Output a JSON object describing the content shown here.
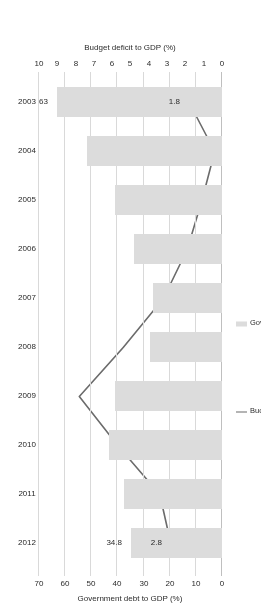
{
  "chart_data": {
    "type": "bar",
    "title": "",
    "orientation": "horizontal",
    "rotated_180": true,
    "categories": [
      "2003",
      "2004",
      "2005",
      "2006",
      "2007",
      "2008",
      "2009",
      "2010",
      "2011",
      "2012"
    ],
    "series": [
      {
        "name": "Government debt to GDP (%)",
        "type": "bar",
        "axis": "top",
        "color": "#dcdcdc",
        "values": [
          63,
          51.5,
          41,
          33.6,
          26.3,
          27.7,
          41.1,
          43.3,
          37.4,
          34.8
        ]
      },
      {
        "name": "Budget deficit to GDP (%)",
        "type": "line",
        "axis": "bottom",
        "color": "#6b6b6b",
        "values": [
          1.8,
          0.4,
          1.1,
          1.9,
          3.2,
          5.4,
          7.8,
          5.7,
          3.4,
          2.8
        ]
      }
    ],
    "data_labels": [
      {
        "category": "2003",
        "series": "Government debt to GDP (%)",
        "text": "63"
      },
      {
        "category": "2003",
        "series": "Budget deficit to GDP (%)",
        "text": "1.8"
      },
      {
        "category": "2012",
        "series": "Government debt to GDP (%)",
        "text": "34.8"
      },
      {
        "category": "2012",
        "series": "Budget deficit to GDP (%)",
        "text": "2.8"
      }
    ],
    "axes": {
      "top": {
        "label": "Government debt to GDP (%)",
        "ticks": [
          "0",
          "10",
          "20",
          "30",
          "40",
          "50",
          "60",
          "70"
        ],
        "min": 0,
        "max": 70,
        "step": 10
      },
      "bottom": {
        "label": "Budget deficit to GDP (%)",
        "ticks": [
          "0",
          "1",
          "2",
          "3",
          "4",
          "5",
          "6",
          "7",
          "8",
          "9",
          "10"
        ],
        "min": 0,
        "max": 10,
        "step": 1
      }
    },
    "grid": true,
    "legend": {
      "position": "right-middle",
      "entries": [
        {
          "label": "Government debt to GDP (%)",
          "marker": "bar-swatch",
          "color": "#dcdcdc"
        },
        {
          "label": "Budget deficit to GDP (%)",
          "marker": "line",
          "color": "#6b6b6b"
        }
      ]
    }
  },
  "labels": {
    "axis_top_title": "Government debt to GDP (%)",
    "axis_bottom_title": "Budget deficit to GDP (%)",
    "legend_debt": "Government debt to GDP (%)",
    "legend_deficit": "Budget deficit to GDP (%)",
    "tick_debt_0": "0",
    "tick_debt_10": "10",
    "tick_debt_20": "20",
    "tick_debt_30": "30",
    "tick_debt_40": "40",
    "tick_debt_50": "50",
    "tick_debt_60": "60",
    "tick_debt_70": "70",
    "tick_def_0": "0",
    "tick_def_1": "1",
    "tick_def_2": "2",
    "tick_def_3": "3",
    "tick_def_4": "4",
    "tick_def_5": "5",
    "tick_def_6": "6",
    "tick_def_7": "7",
    "tick_def_8": "8",
    "tick_def_9": "9",
    "tick_def_10": "10",
    "cat_2003": "2003",
    "cat_2004": "2004",
    "cat_2005": "2005",
    "cat_2006": "2006",
    "cat_2007": "2007",
    "cat_2008": "2008",
    "cat_2009": "2009",
    "cat_2010": "2010",
    "cat_2011": "2011",
    "cat_2012": "2012",
    "dl_debt_2003": "63",
    "dl_def_2003": "1.8",
    "dl_debt_2012": "34.8",
    "dl_def_2012": "2.8"
  }
}
